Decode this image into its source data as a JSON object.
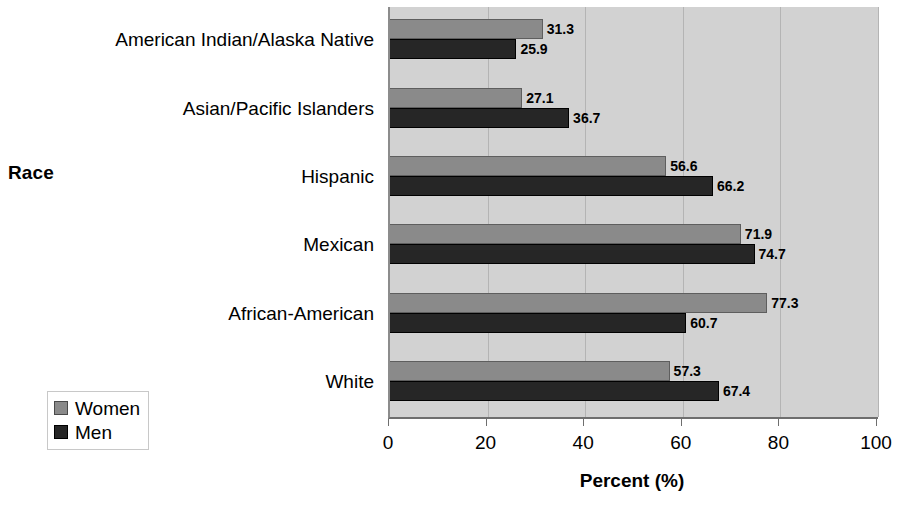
{
  "chart_data": {
    "type": "bar",
    "orientation": "horizontal",
    "title": "",
    "xlabel": "Percent (%)",
    "ylabel": "Race",
    "xlim": [
      0,
      100
    ],
    "xticks": [
      "0",
      "20",
      "40",
      "60",
      "80",
      "100"
    ],
    "grid": true,
    "legend_position": "bottom-left",
    "categories": [
      "American Indian/Alaska Native",
      "Asian/Pacific Islanders",
      "Hispanic",
      "Mexican",
      "African-American",
      "White"
    ],
    "series": [
      {
        "name": "Women",
        "color": "#8a8a8a",
        "values": [
          31.3,
          27.1,
          56.6,
          71.9,
          77.3,
          57.3
        ],
        "labels": [
          "31.3",
          "27.1",
          "56.6",
          "71.9",
          "77.3",
          "57.3"
        ]
      },
      {
        "name": "Men",
        "color": "#262626",
        "values": [
          25.9,
          36.7,
          66.2,
          74.7,
          60.7,
          67.4
        ],
        "labels": [
          "25.9",
          "36.7",
          "66.2",
          "74.7",
          "60.7",
          "67.4"
        ]
      }
    ]
  },
  "legend": {
    "items": [
      {
        "label": "Women",
        "swatch": "women"
      },
      {
        "label": "Men",
        "swatch": "men"
      }
    ]
  },
  "colors": {
    "plot_background": "#d2d2d2",
    "women_bar": "#8a8a8a",
    "men_bar": "#262626",
    "gridline": "#b4b4b4",
    "text": "#000000"
  }
}
